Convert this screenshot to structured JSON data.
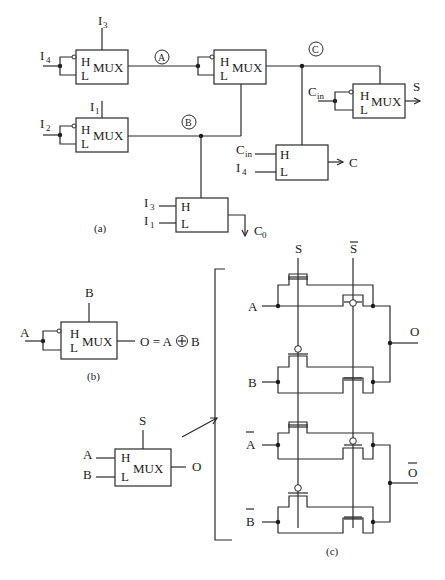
{
  "diagram": {
    "parts": {
      "a": {
        "label": "(a)",
        "mux1": {
          "title": "MUX",
          "h": "H",
          "l": "L",
          "select": "I",
          "select_sub": "3",
          "input": "I",
          "input_sub": "4"
        },
        "mux2": {
          "title": "MUX",
          "h": "H",
          "l": "L",
          "select": "I",
          "select_sub": "1",
          "input": "I",
          "input_sub": "2"
        },
        "mux3": {
          "title": "MUX",
          "h": "H",
          "l": "L"
        },
        "mux4": {
          "title": "MUX",
          "h": "H",
          "l": "L",
          "input": "C",
          "input_sub": "in",
          "output": "S"
        },
        "mux5": {
          "h": "H",
          "l": "L",
          "h_in": "C",
          "h_in_sub": "in",
          "l_in": "I",
          "l_in_sub": "4",
          "output": "C"
        },
        "mux6": {
          "h": "H",
          "l": "L",
          "h_in": "I",
          "h_in_sub": "3",
          "l_in": "I",
          "l_in_sub": "1",
          "output": "C",
          "output_sub": "0"
        },
        "nodes": {
          "A": "A",
          "B": "B",
          "C": "C"
        }
      },
      "b": {
        "label": "(b)",
        "mux": {
          "title": "MUX",
          "h": "H",
          "l": "L",
          "select": "B",
          "input": "A"
        },
        "equation_left": "O = A",
        "xor_symbol": "+",
        "equation_right": "B"
      },
      "c": {
        "label": "(c)",
        "mux": {
          "title": "MUX",
          "h": "H",
          "l": "L",
          "select": "S",
          "in_h": "A",
          "in_l": "B",
          "output": "O"
        },
        "select_top": "S",
        "select_bar_top": "S",
        "inputs": [
          "A",
          "B",
          "A",
          "B"
        ],
        "inputs_inverted": [
          false,
          false,
          true,
          true
        ],
        "outputs": [
          "O",
          "O"
        ],
        "outputs_inverted": [
          false,
          true
        ]
      }
    },
    "caption_partial": "Figure 4.3  (a) Full adder using MUX cells; (b) XOR gate; (c) transmission-gate MUX"
  }
}
